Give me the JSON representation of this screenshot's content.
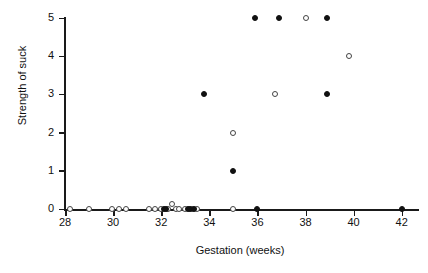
{
  "chart_data": {
    "type": "scatter",
    "title": "",
    "xlabel": "Gestation (weeks)",
    "ylabel": "Strength of suck",
    "xlim": [
      27.2,
      42.8
    ],
    "ylim": [
      -0.25,
      5.2
    ],
    "xticks": [
      28,
      30,
      32,
      34,
      36,
      38,
      40,
      42
    ],
    "xtick_labels": [
      "28",
      "30",
      "32",
      "34",
      "36",
      "38",
      "40",
      "42"
    ],
    "yticks": [
      0,
      1,
      2,
      3,
      4,
      5
    ],
    "ytick_labels": [
      "0",
      "1",
      "2",
      "3",
      "4",
      "5"
    ],
    "grid": false,
    "legend": null,
    "marker_styles": {
      "filled": "filled-circle",
      "open": "open-circle"
    },
    "series": [
      {
        "name": "open",
        "marker": "open-circle",
        "points": [
          [
            28.2,
            0
          ],
          [
            29.0,
            0
          ],
          [
            29.95,
            0
          ],
          [
            30.25,
            0
          ],
          [
            30.55,
            0
          ],
          [
            31.5,
            0
          ],
          [
            31.75,
            0
          ],
          [
            32.0,
            0
          ],
          [
            32.3,
            0
          ],
          [
            32.45,
            0.12
          ],
          [
            32.6,
            0
          ],
          [
            32.75,
            0
          ],
          [
            33.0,
            0
          ],
          [
            33.3,
            0
          ],
          [
            33.5,
            0
          ],
          [
            35.0,
            0
          ],
          [
            35.0,
            2
          ],
          [
            36.75,
            3
          ],
          [
            38.0,
            5
          ],
          [
            39.8,
            4
          ]
        ]
      },
      {
        "name": "filled",
        "marker": "filled-circle",
        "points": [
          [
            32.1,
            0
          ],
          [
            32.2,
            0
          ],
          [
            33.1,
            0
          ],
          [
            33.2,
            0
          ],
          [
            33.35,
            0
          ],
          [
            36.0,
            0
          ],
          [
            42.0,
            0
          ],
          [
            35.0,
            1
          ],
          [
            33.8,
            3
          ],
          [
            38.9,
            3
          ],
          [
            35.9,
            5
          ],
          [
            36.9,
            5
          ],
          [
            38.9,
            5
          ]
        ]
      }
    ]
  }
}
